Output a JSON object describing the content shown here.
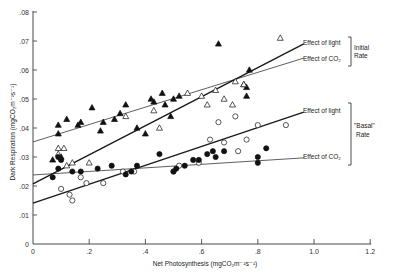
{
  "chart_data": {
    "type": "scatter",
    "title": "",
    "xlabel": "Net Photosynthesis (mgCO2m-2s-1)",
    "ylabel": "Dark Respiration (mgCO2m-2s-1)",
    "xlim": [
      0,
      1.2
    ],
    "ylim": [
      0,
      0.08
    ],
    "x_ticks": [
      "0",
      ".2",
      ".4",
      ".6",
      ".8",
      "1.0",
      "1.2"
    ],
    "x_tick_values": [
      0,
      0.2,
      0.4,
      0.6,
      0.8,
      1.0,
      1.2
    ],
    "y_ticks": [
      "0",
      ".01",
      ".02",
      ".03",
      ".04",
      ".05",
      ".06",
      ".07",
      ".08"
    ],
    "y_tick_values": [
      0,
      0.01,
      0.02,
      0.03,
      0.04,
      0.05,
      0.06,
      0.07,
      0.08
    ],
    "grid": false,
    "series": [
      {
        "name": "Initial Rate - Effect of light",
        "marker": "filled-triangle",
        "points": [
          [
            0.07,
            0.029
          ],
          [
            0.09,
            0.038
          ],
          [
            0.09,
            0.041
          ],
          [
            0.16,
            0.041
          ],
          [
            0.17,
            0.042
          ],
          [
            0.1,
            0.03
          ],
          [
            0.24,
            0.039
          ],
          [
            0.25,
            0.042
          ],
          [
            0.29,
            0.043
          ],
          [
            0.33,
            0.048
          ],
          [
            0.31,
            0.045
          ],
          [
            0.42,
            0.05
          ],
          [
            0.43,
            0.049
          ],
          [
            0.47,
            0.048
          ],
          [
            0.46,
            0.052
          ],
          [
            0.5,
            0.05
          ],
          [
            0.49,
            0.044
          ],
          [
            0.52,
            0.051
          ],
          [
            0.4,
            0.038
          ],
          [
            0.37,
            0.04
          ],
          [
            0.66,
            0.069
          ],
          [
            0.75,
            0.055
          ],
          [
            0.77,
            0.06
          ],
          [
            0.76,
            0.051
          ],
          [
            0.76,
            0.054
          ],
          [
            0.21,
            0.047
          ],
          [
            0.12,
            0.043
          ]
        ]
      },
      {
        "name": "Initial Rate - Effect of CO2",
        "marker": "open-triangle",
        "points": [
          [
            0.09,
            0.033
          ],
          [
            0.11,
            0.033
          ],
          [
            0.09,
            0.031
          ],
          [
            0.12,
            0.027
          ],
          [
            0.14,
            0.028
          ],
          [
            0.2,
            0.028
          ],
          [
            0.33,
            0.044
          ],
          [
            0.43,
            0.046
          ],
          [
            0.45,
            0.04
          ],
          [
            0.55,
            0.052
          ],
          [
            0.6,
            0.051
          ],
          [
            0.68,
            0.05
          ],
          [
            0.62,
            0.048
          ],
          [
            0.65,
            0.053
          ],
          [
            0.72,
            0.056
          ],
          [
            0.75,
            0.055
          ],
          [
            0.71,
            0.048
          ],
          [
            0.88,
            0.071
          ]
        ]
      },
      {
        "name": "Basal Rate - Effect of light",
        "marker": "open-circle",
        "points": [
          [
            0.1,
            0.019
          ],
          [
            0.13,
            0.017
          ],
          [
            0.14,
            0.015
          ],
          [
            0.17,
            0.023
          ],
          [
            0.19,
            0.021
          ],
          [
            0.25,
            0.021
          ],
          [
            0.32,
            0.025
          ],
          [
            0.36,
            0.025
          ],
          [
            0.5,
            0.025
          ],
          [
            0.52,
            0.027
          ],
          [
            0.59,
            0.028
          ],
          [
            0.63,
            0.036
          ],
          [
            0.66,
            0.042
          ],
          [
            0.73,
            0.032
          ],
          [
            0.76,
            0.036
          ],
          [
            0.8,
            0.041
          ],
          [
            0.72,
            0.044
          ],
          [
            0.68,
            0.035
          ],
          [
            0.9,
            0.041
          ]
        ]
      },
      {
        "name": "Basal Rate - Effect of CO2",
        "marker": "filled-circle",
        "points": [
          [
            0.07,
            0.023
          ],
          [
            0.09,
            0.026
          ],
          [
            0.1,
            0.029
          ],
          [
            0.14,
            0.025
          ],
          [
            0.17,
            0.025
          ],
          [
            0.23,
            0.026
          ],
          [
            0.28,
            0.027
          ],
          [
            0.33,
            0.024
          ],
          [
            0.35,
            0.025
          ],
          [
            0.37,
            0.027
          ],
          [
            0.45,
            0.031
          ],
          [
            0.5,
            0.025
          ],
          [
            0.51,
            0.026
          ],
          [
            0.54,
            0.027
          ],
          [
            0.57,
            0.029
          ],
          [
            0.59,
            0.029
          ],
          [
            0.62,
            0.031
          ],
          [
            0.64,
            0.032
          ],
          [
            0.65,
            0.03
          ],
          [
            0.68,
            0.032
          ],
          [
            0.8,
            0.028
          ],
          [
            0.8,
            0.03
          ],
          [
            0.83,
            0.033
          ],
          [
            0.09,
            0.03
          ]
        ]
      }
    ],
    "fit_lines": [
      {
        "name": "Initial Rate - Effect of light",
        "style": "thick",
        "x": [
          0,
          0.96
        ],
        "y": [
          0.0207,
          0.069
        ]
      },
      {
        "name": "Initial Rate - Effect of CO2",
        "style": "thin",
        "x": [
          0,
          0.96
        ],
        "y": [
          0.0352,
          0.0641
        ]
      },
      {
        "name": "Basal Rate - Effect of light",
        "style": "thick",
        "x": [
          0,
          0.96
        ],
        "y": [
          0.0141,
          0.0455
        ]
      },
      {
        "name": "Basal Rate - Effect of CO2",
        "style": "thin",
        "x": [
          0,
          0.96
        ],
        "y": [
          0.0238,
          0.0297
        ]
      }
    ],
    "annotations": [
      {
        "text": "Effect of light",
        "group": "Initial Rate"
      },
      {
        "text": "Effect of CO2",
        "group": "Initial Rate"
      },
      {
        "text": "Effect of light",
        "group": "\"Basal\" Rate"
      },
      {
        "text": "Effect of CO2",
        "group": "\"Basal\" Rate"
      }
    ],
    "legend_position": "right"
  },
  "labels": {
    "ylabel": "Dark Respiration (mgCO₂m⁻²s⁻¹)",
    "xlabel": "Net Photosynthesis (mgCO₂m⁻²s⁻¹)",
    "initial_light": "Effect of light",
    "initial_co2": "Effect of CO₂",
    "initial_group_1": "Initial",
    "initial_group_2": "Rate",
    "basal_light": "Effect of light",
    "basal_co2": "Effect of CO₂",
    "basal_group_1": "\"Basal\"",
    "basal_group_2": "Rate"
  }
}
